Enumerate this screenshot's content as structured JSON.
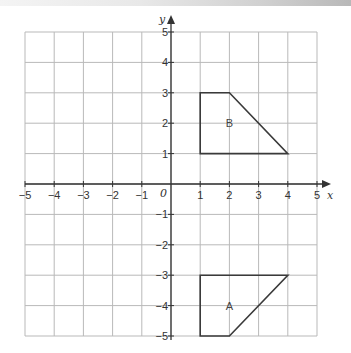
{
  "diagram": {
    "type": "coordinate-grid",
    "x_axis": {
      "label": "x",
      "min": -5,
      "max": 5,
      "ticks": [
        "-5",
        "-4",
        "-3",
        "-2",
        "-1",
        "0",
        "1",
        "2",
        "3",
        "4",
        "5"
      ]
    },
    "y_axis": {
      "label": "y",
      "min": -5,
      "max": 5,
      "ticks": [
        "5",
        "4",
        "3",
        "2",
        "1",
        "-1",
        "-2",
        "-3",
        "-4",
        "-5"
      ]
    },
    "origin_label": "0",
    "shapes": [
      {
        "name": "B",
        "label": "B",
        "vertices": [
          [
            1,
            1
          ],
          [
            1,
            3
          ],
          [
            2,
            3
          ],
          [
            4,
            1
          ]
        ],
        "label_pos": [
          2,
          2
        ]
      },
      {
        "name": "A",
        "label": "A",
        "vertices": [
          [
            1,
            -3
          ],
          [
            1,
            -5
          ],
          [
            2,
            -5
          ],
          [
            4,
            -3
          ]
        ],
        "label_pos": [
          2,
          -4
        ]
      }
    ]
  }
}
